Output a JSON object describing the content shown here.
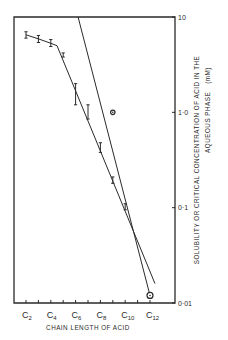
{
  "chart_data": {
    "type": "line",
    "title": "",
    "xlabel": "CHAIN LENGTH OF ACID",
    "ylabel_line1": "SOLUBILITY OR CRITICAL CONCENTRATION OF ACID IN THE",
    "ylabel_line2": "AQUEOUS PHASE",
    "ylabel_unit": "(mM)",
    "yscale": "log",
    "ylim": [
      0.01,
      10
    ],
    "xlim": [
      1,
      13.1
    ],
    "y_axis_position": "right",
    "grid": false,
    "legend": null,
    "x_ticks": [
      2,
      3,
      4,
      5,
      6,
      7,
      8,
      9,
      10,
      11,
      12
    ],
    "x_tick_labels": [
      {
        "x": 2,
        "prefix": "C",
        "sub": "2"
      },
      {
        "x": 4,
        "prefix": "C",
        "sub": "4"
      },
      {
        "x": 6,
        "prefix": "C",
        "sub": "6"
      },
      {
        "x": 8,
        "prefix": "C",
        "sub": "8"
      },
      {
        "x": 10,
        "prefix": "C",
        "sub": "10"
      },
      {
        "x": 12,
        "prefix": "C",
        "sub": "12"
      }
    ],
    "y_ticks": [
      {
        "value": 10,
        "label": "10"
      },
      {
        "value": 1,
        "label": "1·0"
      },
      {
        "value": 0.1,
        "label": "0·1"
      },
      {
        "value": 0.01,
        "label": "0·01"
      }
    ],
    "series": [
      {
        "name": "solubility",
        "marker": "error-bar",
        "x": [
          2,
          3,
          4,
          5,
          6,
          7,
          8,
          9,
          10
        ],
        "values": [
          6.5,
          5.9,
          5.3,
          4.0,
          1.6,
          1.0,
          0.42,
          0.19,
          0.1
        ],
        "error_low": [
          6.0,
          5.4,
          4.9,
          3.8,
          1.2,
          0.85,
          0.38,
          0.18,
          0.095
        ],
        "error_high": [
          7.0,
          6.4,
          5.8,
          4.2,
          2.0,
          1.2,
          0.48,
          0.21,
          0.11
        ],
        "fit_line": {
          "segments": [
            {
              "x": [
                2,
                3,
                4,
                4.5
              ],
              "y": [
                6.5,
                5.9,
                5.3,
                5.0
              ]
            },
            {
              "x": [
                4.5,
                12.4
              ],
              "y": [
                5.0,
                0.016
              ]
            }
          ]
        }
      },
      {
        "name": "critical concentration",
        "marker": "circle",
        "x": [
          9,
          12
        ],
        "values": [
          1.0,
          0.012
        ],
        "fit_line": {
          "x": [
            6.2,
            12.0
          ],
          "y": [
            10,
            0.012
          ]
        }
      }
    ]
  },
  "colors": {
    "ink": "#2a2a2a",
    "background": "#ffffff"
  }
}
